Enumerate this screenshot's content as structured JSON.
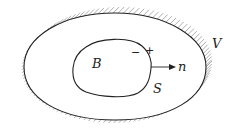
{
  "diagram": {
    "labels": {
      "body": "B",
      "surface": "S",
      "volume": "V",
      "normal": "n",
      "minus_side": "−",
      "plus_side": "+"
    },
    "colors": {
      "stroke": "#222222",
      "hatch": "#9a9a9a"
    }
  }
}
